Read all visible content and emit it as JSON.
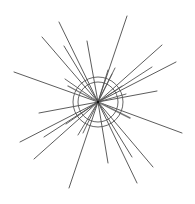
{
  "figure": {
    "type": "starburst",
    "width": 195,
    "height": 204,
    "background": "#ffffff",
    "center": {
      "x": 98,
      "y": 102
    },
    "stroke_color": "#3a3a3a",
    "circles": [
      {
        "r": 25,
        "stroke": "#555555",
        "width": 0.9
      },
      {
        "r": 20,
        "stroke": "#555555",
        "width": 0.9
      }
    ],
    "rays": [
      {
        "x": 59,
        "y": 22,
        "w": 0.9,
        "c": "#4a4a4a"
      },
      {
        "x": 127,
        "y": 16,
        "w": 0.9,
        "c": "#4a4a4a"
      },
      {
        "x": 42,
        "y": 37,
        "w": 0.9,
        "c": "#4a4a4a"
      },
      {
        "x": 64,
        "y": 46,
        "w": 0.9,
        "c": "#4a4a4a"
      },
      {
        "x": 87,
        "y": 41,
        "w": 0.9,
        "c": "#4a4a4a"
      },
      {
        "x": 14,
        "y": 72,
        "w": 0.9,
        "c": "#4a4a4a"
      },
      {
        "x": 65,
        "y": 79,
        "w": 0.9,
        "c": "#555555"
      },
      {
        "x": 68,
        "y": 86,
        "w": 1.4,
        "c": "#777777"
      },
      {
        "x": 108,
        "y": 70,
        "w": 0.9,
        "c": "#555555"
      },
      {
        "x": 115,
        "y": 68,
        "w": 0.9,
        "c": "#555555"
      },
      {
        "x": 112,
        "y": 74,
        "w": 0.9,
        "c": "#555555"
      },
      {
        "x": 162,
        "y": 45,
        "w": 0.9,
        "c": "#4a4a4a"
      },
      {
        "x": 176,
        "y": 62,
        "w": 0.9,
        "c": "#4a4a4a"
      },
      {
        "x": 152,
        "y": 67,
        "w": 0.9,
        "c": "#555555"
      },
      {
        "x": 157,
        "y": 91,
        "w": 0.9,
        "c": "#4a4a4a"
      },
      {
        "x": 182,
        "y": 133,
        "w": 0.9,
        "c": "#4a4a4a"
      },
      {
        "x": 130,
        "y": 118,
        "w": 1.4,
        "c": "#777777"
      },
      {
        "x": 153,
        "y": 167,
        "w": 0.9,
        "c": "#4a4a4a"
      },
      {
        "x": 137,
        "y": 183,
        "w": 0.9,
        "c": "#4a4a4a"
      },
      {
        "x": 132,
        "y": 157,
        "w": 0.9,
        "c": "#4a4a4a"
      },
      {
        "x": 108,
        "y": 163,
        "w": 0.9,
        "c": "#4a4a4a"
      },
      {
        "x": 69,
        "y": 188,
        "w": 0.9,
        "c": "#4a4a4a"
      },
      {
        "x": 83,
        "y": 133,
        "w": 0.9,
        "c": "#555555"
      },
      {
        "x": 78,
        "y": 135,
        "w": 0.9,
        "c": "#555555"
      },
      {
        "x": 34,
        "y": 159,
        "w": 0.9,
        "c": "#4a4a4a"
      },
      {
        "x": 44,
        "y": 137,
        "w": 0.9,
        "c": "#4a4a4a"
      },
      {
        "x": 20,
        "y": 142,
        "w": 0.9,
        "c": "#4a4a4a"
      },
      {
        "x": 39,
        "y": 113,
        "w": 0.9,
        "c": "#4a4a4a"
      },
      {
        "x": 66,
        "y": 124,
        "w": 0.9,
        "c": "#555555"
      },
      {
        "x": 126,
        "y": 94,
        "w": 0.9,
        "c": "#555555"
      },
      {
        "x": 122,
        "y": 86,
        "w": 0.9,
        "c": "#555555"
      }
    ]
  }
}
